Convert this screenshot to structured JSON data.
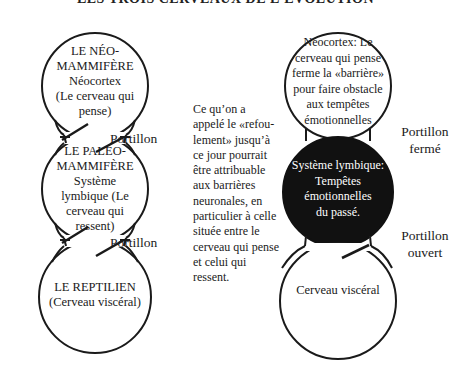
{
  "title": "LES TROIS CERVEAUX DE L'ÉVOLUTION",
  "left_diagram": {
    "circles": [
      {
        "lines": [
          "LE NÉO-",
          "MAMMIFÈRE",
          "Néocortex",
          "(Le cerveau qui",
          "pense)"
        ]
      },
      {
        "lines": [
          "LE PALÉO-",
          "MAMMIFÈRE",
          "Système",
          "lymbique (Le",
          "cerveau qui",
          "ressent)"
        ]
      },
      {
        "lines": [
          "LE REPTILIEN",
          "(Cerveau viscéral)"
        ]
      }
    ],
    "gates": [
      {
        "label": "Portillon"
      },
      {
        "label": "Portillon"
      }
    ]
  },
  "explanation": {
    "lines": [
      "Ce qu’on a",
      "appelé le «refou-",
      "lement» jusqu’à",
      "ce jour pourrait",
      "être attribuable",
      "aux barrières",
      "neuronales, en",
      "particulier à celle",
      "située entre le",
      "cerveau qui pense",
      "et celui qui",
      "ressent."
    ]
  },
  "right_diagram": {
    "circles": [
      {
        "lines": [
          "Néocortex: Le",
          "cerveau qui pense",
          "ferme la «barrière»",
          "pour faire obstacle",
          "aux tempêtes",
          "émotionnelles"
        ]
      },
      {
        "lines": [
          "Système lymbique:",
          "Tempêtes",
          "émotionnelles",
          "du passé."
        ],
        "fill": "#111111"
      },
      {
        "lines": [
          "Cerveau viscéral"
        ]
      }
    ],
    "gates": [
      {
        "label_lines": [
          "Portillon",
          "fermé"
        ]
      },
      {
        "label_lines": [
          "Portillon",
          "ouvert"
        ]
      }
    ]
  },
  "colors": {
    "stroke": "#1a1a1a",
    "dark_fill": "#111111",
    "background": "#ffffff"
  }
}
